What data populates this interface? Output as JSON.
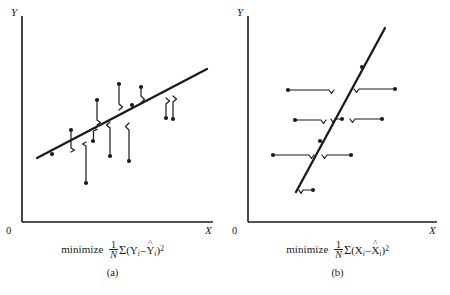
{
  "figure": {
    "background_color": "#ffffff",
    "ink_color": "#1a1a1a"
  },
  "panels": [
    {
      "id": "a",
      "label": "(a)",
      "axes": {
        "y_label": "Y",
        "x_label": "X",
        "origin_label": "0",
        "x_axis": {
          "x1": 22,
          "y1": 222,
          "x2": 213,
          "y2": 222
        },
        "y_axis": {
          "x1": 22,
          "y1": 16,
          "x2": 22,
          "y2": 222
        }
      },
      "regression_line": {
        "x1": 37,
        "y1": 158,
        "x2": 207,
        "y2": 69
      },
      "formula": {
        "word": "minimize",
        "fraction_numerator": "1",
        "fraction_denominator": "N",
        "sigma": "Σ",
        "open_paren": "(",
        "term1_var": "Y",
        "term1_sub": "i",
        "minus": "–",
        "term2_var": "Y",
        "term2_hat": "^",
        "term2_sub": "i",
        "close_paren": ")",
        "exponent": "2",
        "plain_text": "minimize 1/N Σ(Yᵢ – Ŷᵢ)²"
      },
      "residual_orientation": "vertical",
      "points": [
        {
          "x": 52,
          "y": 154,
          "residual_to_line_y": 150.0,
          "bracket": "none"
        },
        {
          "x": 71,
          "y": 130,
          "residual_to_line_y": 150.0,
          "bracket": "vertical"
        },
        {
          "x": 86,
          "y": 183,
          "residual_to_line_y": 142.2,
          "bracket": "vertical"
        },
        {
          "x": 93,
          "y": 141,
          "residual_to_line_y": 128.6,
          "bracket": "vertical-short"
        },
        {
          "x": 97,
          "y": 100,
          "residual_to_line_y": 127.0,
          "bracket": "vertical"
        },
        {
          "x": 110,
          "y": 156,
          "residual_to_line_y": 120.2,
          "bracket": "vertical"
        },
        {
          "x": 119,
          "y": 84,
          "residual_to_line_y": 115.5,
          "bracket": "vertical"
        },
        {
          "x": 129,
          "y": 161,
          "residual_to_line_y": 110.3,
          "bracket": "vertical"
        },
        {
          "x": 132,
          "y": 105,
          "residual_to_line_y": 108.7,
          "bracket": "vertical"
        },
        {
          "x": 141,
          "y": 87,
          "residual_to_line_y": 104.0,
          "bracket": "vertical"
        },
        {
          "x": 166,
          "y": 118,
          "residual_to_line_y": 90.9,
          "bracket": "vertical"
        },
        {
          "x": 173,
          "y": 119,
          "residual_to_line_y": 87.2,
          "bracket": "vertical"
        }
      ]
    },
    {
      "id": "b",
      "label": "(b)",
      "axes": {
        "y_label": "Y",
        "x_label": "X",
        "origin_label": "0",
        "x_axis": {
          "x1": 23,
          "y1": 222,
          "x2": 212,
          "y2": 222
        },
        "y_axis": {
          "x1": 23,
          "y1": 16,
          "x2": 23,
          "y2": 222
        }
      },
      "regression_line": {
        "x1": 71,
        "y1": 192,
        "x2": 160,
        "y2": 28
      },
      "formula": {
        "word": "minimize",
        "fraction_numerator": "1",
        "fraction_denominator": "N",
        "sigma": "Σ",
        "open_paren": "(",
        "term1_var": "X",
        "term1_sub": "i",
        "minus": "–",
        "term2_var": "X",
        "term2_hat": "^",
        "term2_sub": "i",
        "close_paren": ")",
        "exponent": "2",
        "plain_text": "minimize 1/N Σ(Xᵢ – X̂ᵢ)²"
      },
      "residual_orientation": "horizontal",
      "points": [
        {
          "x": 88,
          "y": 190,
          "residual_to_line_x": 70.0,
          "bracket": "horizontal-short"
        },
        {
          "x": 48,
          "y": 155,
          "residual_to_line_x": 90.2,
          "bracket": "horizontal"
        },
        {
          "x": 126,
          "y": 155,
          "residual_to_line_x": 90.2,
          "bracket": "horizontal"
        },
        {
          "x": 95,
          "y": 141,
          "residual_to_line_x": 97.8,
          "bracket": "none"
        },
        {
          "x": 70,
          "y": 120,
          "residual_to_line_x": 109.2,
          "bracket": "horizontal"
        },
        {
          "x": 117,
          "y": 119,
          "residual_to_line_x": 109.8,
          "bracket": "horizontal-short"
        },
        {
          "x": 157,
          "y": 119,
          "residual_to_line_x": 109.8,
          "bracket": "horizontal"
        },
        {
          "x": 63,
          "y": 90,
          "residual_to_line_x": 125.5,
          "bracket": "horizontal"
        },
        {
          "x": 170,
          "y": 89,
          "residual_to_line_x": 126.1,
          "bracket": "horizontal"
        },
        {
          "x": 137,
          "y": 67,
          "residual_to_line_x": 138.0,
          "bracket": "none"
        }
      ]
    }
  ]
}
